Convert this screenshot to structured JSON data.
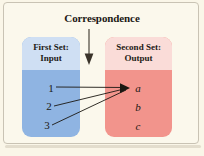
{
  "figure": {
    "title": "Correspondence",
    "background_color": "#faf6e8",
    "frame_color": "#c9c3b4"
  },
  "input_set": {
    "title_line1": "First Set:",
    "title_line2": "Input",
    "header_color": "#cfdff3",
    "body_color": "#8fb4e2",
    "elements": [
      "1",
      "2",
      "3"
    ]
  },
  "output_set": {
    "title_line1": "Second Set:",
    "title_line2": "Output",
    "header_color": "#fadcd8",
    "body_color": "#f2948c",
    "elements": [
      "a",
      "b",
      "c"
    ]
  },
  "mapping": {
    "arrow_color": "#1b1712",
    "pairs": [
      {
        "from": "1",
        "to": "a"
      },
      {
        "from": "2",
        "to": "a"
      },
      {
        "from": "3",
        "to": "a"
      }
    ]
  },
  "pointer": {
    "icon": "down-arrow-icon",
    "color": "#3a332a"
  }
}
